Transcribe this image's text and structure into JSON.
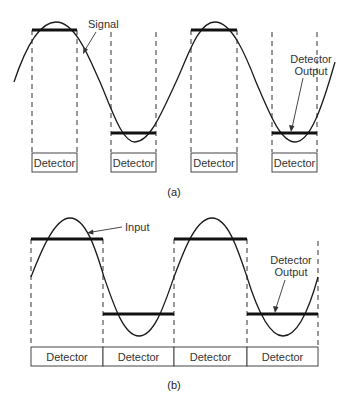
{
  "figure_a": {
    "caption": "(a)",
    "signal_label": "Signal",
    "output_label_line1": "Detector",
    "output_label_line2": "Output",
    "detectors": [
      "Detector",
      "Detector",
      "Detector",
      "Detector"
    ]
  },
  "figure_b": {
    "caption": "(b)",
    "input_label": "Input",
    "output_label_line1": "Detector",
    "output_label_line2": "Output",
    "detectors": [
      "Detector",
      "Detector",
      "Detector",
      "Detector"
    ]
  },
  "colors": {
    "line": "#1a1a1a",
    "bar": "#111111",
    "dashed": "#333333",
    "text": "#333333"
  }
}
